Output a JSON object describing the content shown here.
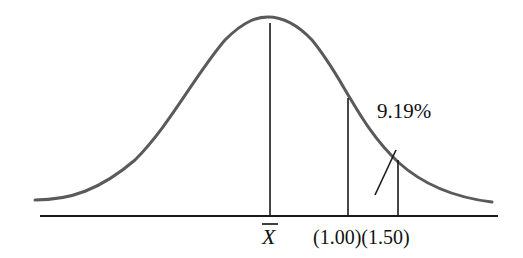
{
  "diagram": {
    "type": "normal-distribution-curve",
    "mean_label": "X",
    "mean_label_has_overbar": true,
    "markers": [
      {
        "label": "(1.00)",
        "value": 1.0
      },
      {
        "label": "(1.50)",
        "value": 1.5
      }
    ],
    "marker_labels_combined": "(1.00)(1.50)",
    "shaded_region_annotation": "9.19%",
    "colors": {
      "curve": "#5a5a5a",
      "lines": "#1a1a1a",
      "text": "#111111",
      "background": "#ffffff"
    }
  }
}
